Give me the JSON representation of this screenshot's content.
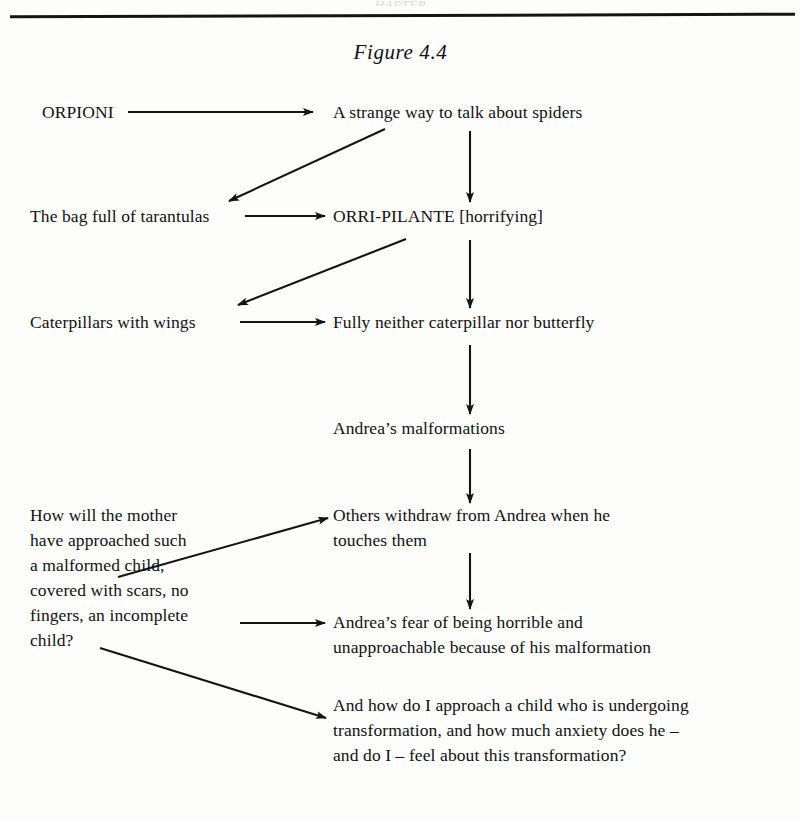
{
  "page": {
    "running_head": "HAPTER",
    "figure_title": "Figure 4.4"
  },
  "nodes": {
    "orpioni": "ORPIONI",
    "strange_way": "A strange way to talk about spiders",
    "bag_tarantulas": "The bag full of tarantulas",
    "orri_pilante": "ORRI-PILANTE [horrifying]",
    "caterpillars_wings": "Caterpillars with wings",
    "fully_neither": "Fully neither caterpillar nor butterfly",
    "andreas_malformations": "Andrea’s malformations",
    "mother_question": "How will the mother\nhave approached such\na malformed child,\ncovered with scars, no\nfingers, an incomplete\nchild?",
    "others_withdraw": "Others withdraw from Andrea when he\ntouches them",
    "andreas_fear": "Andrea’s fear of being horrible and\nunapproachable because of his malformation",
    "how_do_i_approach": "And how do I approach a child who is undergoing\ntransformation, and how much anxiety does he –\nand do I – feel about this transformation?"
  },
  "arrows": [
    {
      "name": "arrow-orpioni-to-strange-way",
      "kind": "horizontal",
      "from": [
        128,
        112
      ],
      "to": [
        313,
        112
      ]
    },
    {
      "name": "arrow-strange-way-to-bag-tarantulas",
      "kind": "diagonal",
      "from": [
        385,
        129
      ],
      "to": [
        229,
        201
      ]
    },
    {
      "name": "arrow-strange-way-to-orri-pilante",
      "kind": "vertical",
      "from": [
        470,
        131
      ],
      "to": [
        470,
        202
      ]
    },
    {
      "name": "arrow-bag-to-orri-pilante",
      "kind": "horizontal",
      "from": [
        245,
        216
      ],
      "to": [
        325,
        216
      ]
    },
    {
      "name": "arrow-orri-to-caterpillars",
      "kind": "diagonal",
      "from": [
        406,
        239
      ],
      "to": [
        238,
        305
      ]
    },
    {
      "name": "arrow-orri-to-fully-neither",
      "kind": "vertical",
      "from": [
        470,
        240
      ],
      "to": [
        470,
        308
      ]
    },
    {
      "name": "arrow-caterpillars-to-fully-neither",
      "kind": "horizontal",
      "from": [
        240,
        322
      ],
      "to": [
        325,
        322
      ]
    },
    {
      "name": "arrow-fully-to-malformations",
      "kind": "vertical",
      "from": [
        470,
        345
      ],
      "to": [
        470,
        414
      ]
    },
    {
      "name": "arrow-malformations-to-others",
      "kind": "vertical",
      "from": [
        470,
        449
      ],
      "to": [
        470,
        503
      ]
    },
    {
      "name": "arrow-mother-to-others",
      "kind": "diagonal",
      "from": [
        118,
        577
      ],
      "to": [
        328,
        518
      ]
    },
    {
      "name": "arrow-others-to-fear",
      "kind": "vertical",
      "from": [
        470,
        553
      ],
      "to": [
        470,
        609
      ]
    },
    {
      "name": "arrow-mother-to-fear",
      "kind": "horizontal",
      "from": [
        240,
        623
      ],
      "to": [
        325,
        623
      ]
    },
    {
      "name": "arrow-child-to-approach",
      "kind": "diagonal",
      "from": [
        100,
        648
      ],
      "to": [
        326,
        718
      ]
    }
  ],
  "colors": {
    "ink": "#141414",
    "paper": "#fdfdfc"
  }
}
